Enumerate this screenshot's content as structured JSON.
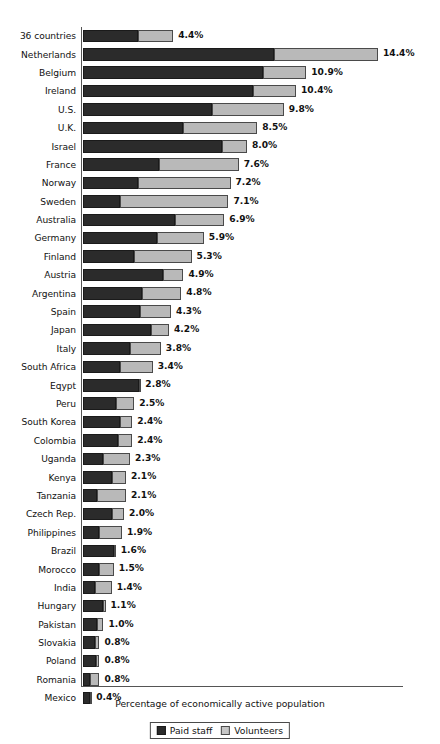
{
  "chart_data": {
    "type": "bar",
    "subtype": "stacked-horizontal-bar",
    "title": "",
    "xlabel": "Percentage of economically active population",
    "ylabel": "",
    "xlim": [
      0,
      15.6
    ],
    "grid": false,
    "legend_position": "bottom-center",
    "legend": [
      "Paid staff",
      "Volunteers"
    ],
    "value_label_suffix": "%",
    "categories": [
      "36 countries",
      "Netherlands",
      "Belgium",
      "Ireland",
      "U.S.",
      "U.K.",
      "Israel",
      "France",
      "Norway",
      "Sweden",
      "Australia",
      "Germany",
      "Finland",
      "Austria",
      "Argentina",
      "Spain",
      "Japan",
      "Italy",
      "South Africa",
      "Eqypt",
      "Peru",
      "South Korea",
      "Colombia",
      "Uganda",
      "Kenya",
      "Tanzania",
      "Czech Rep.",
      "Philippines",
      "Brazil",
      "Morocco",
      "India",
      "Hungary",
      "Pakistan",
      "Slovakia",
      "Poland",
      "Romania",
      "Mexico"
    ],
    "series": [
      {
        "name": "Paid staff",
        "color": "#2b2b2b",
        "values": [
          2.7,
          9.3,
          8.8,
          8.3,
          6.3,
          4.9,
          6.8,
          3.7,
          2.7,
          1.8,
          4.5,
          3.6,
          2.5,
          3.9,
          2.9,
          2.8,
          3.3,
          2.3,
          1.8,
          2.75,
          1.6,
          1.8,
          1.7,
          1.0,
          1.4,
          0.7,
          1.4,
          0.8,
          1.5,
          0.8,
          0.6,
          1.0,
          0.7,
          0.6,
          0.65,
          0.35,
          0.35
        ]
      },
      {
        "name": "Volunteers",
        "color": "#b9b9b9",
        "values": [
          1.7,
          5.1,
          2.1,
          2.1,
          3.5,
          3.6,
          1.2,
          3.9,
          4.5,
          5.3,
          2.4,
          2.3,
          2.8,
          1.0,
          1.9,
          1.5,
          0.9,
          1.5,
          1.6,
          0.05,
          0.9,
          0.6,
          0.7,
          1.3,
          0.7,
          1.4,
          0.6,
          1.1,
          0.1,
          0.7,
          0.8,
          0.1,
          0.3,
          0.2,
          0.15,
          0.45,
          0.05
        ]
      }
    ],
    "totals": [
      "4.4%",
      "14.4%",
      "10.9%",
      "10.4%",
      "9.8%",
      "8.5%",
      "8.0%",
      "7.6%",
      "7.2%",
      "7.1%",
      "6.9%",
      "5.9%",
      "5.3%",
      "4.9%",
      "4.8%",
      "4.3%",
      "4.2%",
      "3.8%",
      "3.4%",
      "2.8%",
      "2.5%",
      "2.4%",
      "2.4%",
      "2.3%",
      "2.1%",
      "2.1%",
      "2.0%",
      "1.9%",
      "1.6%",
      "1.5%",
      "1.4%",
      "1.1%",
      "1.0%",
      "0.8%",
      "0.8%",
      "0.8%",
      "0.4%"
    ]
  },
  "colors": {
    "paid_staff": "#2b2b2b",
    "volunteers": "#b9b9b9",
    "axis": "#555555",
    "background": "#ffffff",
    "text": "#111111"
  }
}
